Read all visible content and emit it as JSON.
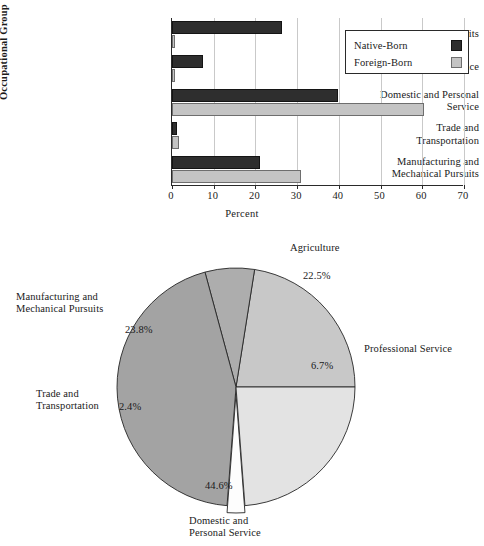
{
  "figure": {
    "bar_chart": {
      "y_axis_title": "Occupational Group",
      "x_axis_title": "Percent",
      "x_ticks": [
        "0",
        "10",
        "20",
        "30",
        "40",
        "50",
        "60",
        "70"
      ],
      "categories": [
        "Agricultural Pursuits",
        "Professional Service",
        "Domestic and Personal Service",
        "Trade and Transportation",
        "Manufacturing and Mechanical Pursuits"
      ],
      "category_lines": [
        [
          "Agricultural Pursuits"
        ],
        [
          "Professional Service"
        ],
        [
          "Domestic and Personal",
          "Service"
        ],
        [
          "Trade and",
          "Transportation"
        ],
        [
          "Manufacturing and",
          "Mechanical Pursuits"
        ]
      ],
      "legend": {
        "native_label": "Native-Born",
        "foreign_label": "Foreign-Born",
        "native_color": "#2e2e2e",
        "foreign_color": "#c4c4c4"
      }
    },
    "pie_chart": {
      "slices": [
        {
          "label_lines": [
            "Agriculture"
          ],
          "value_label": "22.5%",
          "color": "#c8c8c8"
        },
        {
          "label_lines": [
            "Professional Service"
          ],
          "value_label": "6.7%",
          "color": "#adadad"
        },
        {
          "label_lines": [
            "Domestic and",
            "Personal Service"
          ],
          "value_label": "44.6%",
          "color": "#a3a3a3"
        },
        {
          "label_lines": [
            "Trade and",
            "Transportation"
          ],
          "value_label": "2.4%",
          "color": "#fdfdfd"
        },
        {
          "label_lines": [
            "Manufacturing and",
            "Mechanical Pursuits"
          ],
          "value_label": "23.8%",
          "color": "#e3e3e3"
        }
      ]
    }
  },
  "chart_data": [
    {
      "type": "bar",
      "title": "",
      "orientation": "horizontal",
      "xlabel": "Percent",
      "ylabel": "Occupational Group",
      "xlim": [
        0,
        70
      ],
      "xticks": [
        0,
        10,
        20,
        30,
        40,
        50,
        60,
        70
      ],
      "grid": true,
      "legend_position": "top-right",
      "categories": [
        "Agricultural Pursuits",
        "Professional Service",
        "Domestic and Personal Service",
        "Trade and Transportation",
        "Manufacturing and Mechanical Pursuits"
      ],
      "series": [
        {
          "name": "Native-Born",
          "color": "#2e2e2e",
          "values": [
            26.4,
            7.4,
            39.8,
            1.2,
            21.1
          ]
        },
        {
          "name": "Foreign-Born",
          "color": "#c4c4c4",
          "values": [
            0.4,
            0.5,
            60.4,
            1.7,
            30.9
          ]
        }
      ]
    },
    {
      "type": "pie",
      "title": "",
      "unit": "percent",
      "start_angle_deg": 0,
      "direction": "counterclockwise",
      "exploded_slices": [
        "Trade and Transportation"
      ],
      "labels": [
        "Agriculture",
        "Professional Service",
        "Domestic and Personal Service",
        "Trade and Transportation",
        "Manufacturing and Mechanical Pursuits"
      ],
      "values": [
        22.5,
        6.7,
        44.6,
        2.4,
        23.8
      ],
      "colors": [
        "#c8c8c8",
        "#adadad",
        "#a3a3a3",
        "#fdfdfd",
        "#e3e3e3"
      ]
    }
  ]
}
